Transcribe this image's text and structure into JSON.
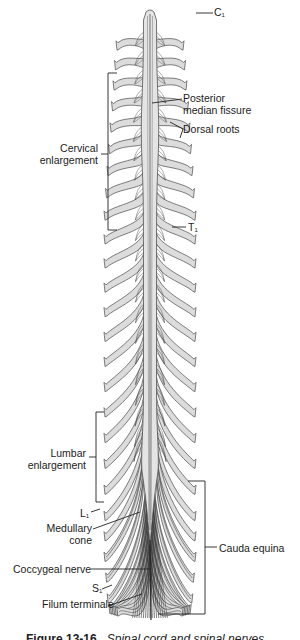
{
  "figure": {
    "type": "anatomical-illustration",
    "caption": {
      "number": "Figure 13-16",
      "text": "Spinal cord and spinal nerves",
      "visibility": "truncated at bottom edge"
    }
  },
  "labels": {
    "c1": {
      "main": "C",
      "sub": "1"
    },
    "posterior_median_fissure": {
      "line1": "Posterior",
      "line2": "median fissure"
    },
    "dorsal_roots": "Dorsal roots",
    "cervical_enlargement": {
      "line1": "Cervical",
      "line2": "enlargement"
    },
    "t1": {
      "main": "T",
      "sub": "1"
    },
    "lumbar_enlargement": {
      "line1": "Lumbar",
      "line2": "enlargement"
    },
    "l1": {
      "main": "L",
      "sub": "1"
    },
    "medullary_cone": {
      "line1": "Medullary",
      "line2": "cone"
    },
    "coccygeal_nerve": "Coccygeal nerve",
    "s1": {
      "main": "S",
      "sub": "1"
    },
    "filum_terminale": "Filum terminale",
    "cauda_equina": "Cauda equina"
  },
  "colors": {
    "cord_fill": "#e4e4e4",
    "cord_stroke": "#555555",
    "nerve_fill": "#dcdcdc",
    "nerve_stroke": "#4a4a4a",
    "cauda_dark": "#2a2a2a",
    "leader_line": "#222222",
    "background": "#ffffff"
  },
  "anatomy": {
    "cord_center_x": 150,
    "cord_top_y": 12,
    "nerve_pairs": 31,
    "segments": {
      "cervical": 8,
      "thoracic": 12,
      "lumbar": 5,
      "sacral": 5,
      "coccygeal": 1
    }
  }
}
